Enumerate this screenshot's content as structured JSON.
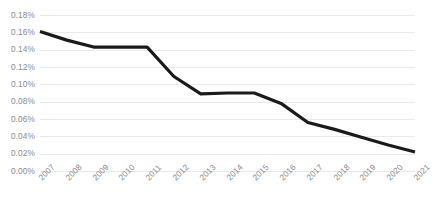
{
  "chart_data": {
    "type": "line",
    "title": "",
    "subtitle": "",
    "xlabel": "",
    "ylabel": "",
    "categories": [
      "2007",
      "2008",
      "2009",
      "2010",
      "2011",
      "2012",
      "2013",
      "2014",
      "2015",
      "2016",
      "2017",
      "2018",
      "2019",
      "2020",
      "2021"
    ],
    "series": [
      {
        "name": "",
        "values": [
          0.161,
          0.151,
          0.143,
          0.143,
          0.143,
          0.109,
          0.089,
          0.09,
          0.09,
          0.078,
          0.056,
          0.048,
          0.039,
          0.03,
          0.022
        ],
        "color": "#1a1a1a",
        "line_width": 3.2
      }
    ],
    "ylim": [
      0.0,
      0.18
    ],
    "y_ticks": [
      0.0,
      0.02,
      0.04,
      0.06,
      0.08,
      0.1,
      0.12,
      0.14,
      0.16,
      0.18
    ],
    "y_tick_labels": [
      "0.00%",
      "0.02%",
      "0.04%",
      "0.06%",
      "0.08%",
      "0.10%",
      "0.12%",
      "0.14%",
      "0.16%",
      "0.18%"
    ],
    "x_tick_labels": [
      "2007",
      "2008",
      "2009",
      "2010",
      "2011",
      "2012",
      "2013",
      "2014",
      "2015",
      "2016",
      "2017",
      "2018",
      "2019",
      "2020",
      "2021"
    ],
    "grid": {
      "horizontal": true,
      "vertical": false,
      "color": "#e9e9e9"
    },
    "legend": {
      "visible": false,
      "position": "none",
      "entries": []
    },
    "axis_label_color": "#8a8a8a",
    "background_color": "#ffffff",
    "x_label_rotation_degrees": -45,
    "annotations": []
  }
}
